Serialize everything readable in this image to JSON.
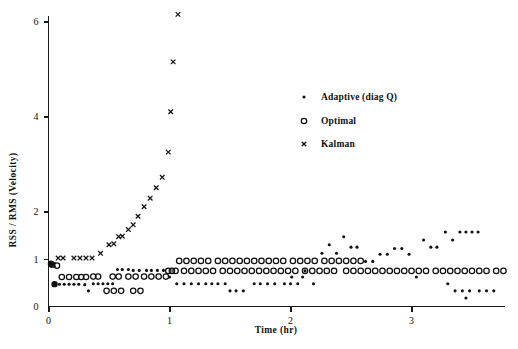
{
  "chart_data": {
    "type": "scatter",
    "title": "",
    "xlabel": "Time (hr)",
    "ylabel": "RSS / RMS (Velocity)",
    "xlim": [
      0,
      3.87
    ],
    "ylim": [
      0,
      6.45
    ],
    "xticks": [
      0,
      1,
      2,
      3
    ],
    "xticklabels": [
      "0",
      "1",
      "2",
      "3"
    ],
    "yticks": [
      0,
      1,
      2,
      4,
      6
    ],
    "yticklabels": [
      "0",
      "1",
      "2",
      "4",
      "6"
    ],
    "grid": false,
    "legend_position": "upper-center-right",
    "series": [
      {
        "name": "Adaptive (diag Q)",
        "marker": "dot",
        "points": [
          [
            0.02,
            0.9
          ],
          [
            0.05,
            0.47
          ],
          [
            0.09,
            0.47
          ],
          [
            0.13,
            0.47
          ],
          [
            0.21,
            0.47
          ],
          [
            0.25,
            0.47
          ],
          [
            0.3,
            0.46
          ],
          [
            0.33,
            0.33
          ],
          [
            0.37,
            0.48
          ],
          [
            0.45,
            0.48
          ],
          [
            0.49,
            0.48
          ],
          [
            0.53,
            0.48
          ],
          [
            0.61,
            0.78
          ],
          [
            0.66,
            0.78
          ],
          [
            0.75,
            0.76
          ],
          [
            0.81,
            0.76
          ],
          [
            0.9,
            0.76
          ],
          [
            0.95,
            0.76
          ],
          [
            1.0,
            0.62
          ],
          [
            1.06,
            0.48
          ],
          [
            1.12,
            0.48
          ],
          [
            1.18,
            0.48
          ],
          [
            1.3,
            0.48
          ],
          [
            1.35,
            0.48
          ],
          [
            1.4,
            0.48
          ],
          [
            1.46,
            0.48
          ],
          [
            1.55,
            0.33
          ],
          [
            1.61,
            0.33
          ],
          [
            1.7,
            0.48
          ],
          [
            1.75,
            0.48
          ],
          [
            1.81,
            0.48
          ],
          [
            1.87,
            0.48
          ],
          [
            1.95,
            0.48
          ],
          [
            2.0,
            0.48
          ],
          [
            2.06,
            0.48
          ],
          [
            2.1,
            0.62
          ],
          [
            2.12,
            0.75
          ],
          [
            2.19,
            0.48
          ],
          [
            2.26,
            1.12
          ],
          [
            2.32,
            1.3
          ],
          [
            2.38,
            1.12
          ],
          [
            2.44,
            1.47
          ],
          [
            2.5,
            1.25
          ],
          [
            2.55,
            1.25
          ],
          [
            2.62,
            0.95
          ],
          [
            2.68,
            0.95
          ],
          [
            2.74,
            1.1
          ],
          [
            2.8,
            1.1
          ],
          [
            2.86,
            1.22
          ],
          [
            2.92,
            1.22
          ],
          [
            2.98,
            1.1
          ],
          [
            3.04,
            0.62
          ],
          [
            3.1,
            1.4
          ],
          [
            3.16,
            1.25
          ],
          [
            3.21,
            1.25
          ],
          [
            3.28,
            1.57
          ],
          [
            3.34,
            1.4
          ],
          [
            3.4,
            1.57
          ],
          [
            3.45,
            1.57
          ],
          [
            3.5,
            1.57
          ],
          [
            3.55,
            1.57
          ],
          [
            3.3,
            0.48
          ],
          [
            3.36,
            0.33
          ],
          [
            3.42,
            0.33
          ],
          [
            3.48,
            0.33
          ],
          [
            3.56,
            0.33
          ],
          [
            3.62,
            0.33
          ],
          [
            3.45,
            0.18
          ],
          [
            0.17,
            0.47
          ],
          [
            0.41,
            0.48
          ],
          [
            0.57,
            0.78
          ],
          [
            0.7,
            0.76
          ],
          [
            0.85,
            0.76
          ],
          [
            1.24,
            0.48
          ],
          [
            1.5,
            0.33
          ],
          [
            2.01,
            0.62
          ],
          [
            3.68,
            0.33
          ]
        ]
      },
      {
        "name": "Optimal",
        "marker": "circle",
        "points": [
          [
            0.03,
            0.88
          ],
          [
            0.07,
            0.86
          ],
          [
            0.11,
            0.62
          ],
          [
            0.17,
            0.62
          ],
          [
            0.23,
            0.62
          ],
          [
            0.27,
            0.62
          ],
          [
            0.31,
            0.62
          ],
          [
            0.37,
            0.63
          ],
          [
            0.41,
            0.63
          ],
          [
            0.48,
            0.33
          ],
          [
            0.54,
            0.33
          ],
          [
            0.6,
            0.33
          ],
          [
            0.7,
            0.33
          ],
          [
            0.76,
            0.33
          ],
          [
            0.53,
            0.63
          ],
          [
            0.58,
            0.63
          ],
          [
            0.66,
            0.63
          ],
          [
            0.72,
            0.63
          ],
          [
            0.79,
            0.63
          ],
          [
            0.85,
            0.63
          ],
          [
            0.91,
            0.63
          ],
          [
            0.97,
            0.63
          ],
          [
            1.02,
            0.75
          ],
          [
            1.08,
            0.96
          ],
          [
            1.14,
            0.96
          ],
          [
            1.2,
            0.96
          ],
          [
            1.26,
            0.96
          ],
          [
            1.32,
            0.96
          ],
          [
            1.4,
            0.96
          ],
          [
            1.46,
            0.96
          ],
          [
            1.52,
            0.96
          ],
          [
            1.58,
            0.96
          ],
          [
            1.64,
            0.96
          ],
          [
            1.7,
            0.96
          ],
          [
            1.76,
            0.96
          ],
          [
            1.82,
            0.96
          ],
          [
            1.88,
            0.96
          ],
          [
            1.94,
            0.96
          ],
          [
            2.02,
            0.96
          ],
          [
            2.08,
            0.96
          ],
          [
            2.14,
            0.96
          ],
          [
            2.2,
            0.96
          ],
          [
            2.28,
            0.96
          ],
          [
            2.34,
            0.96
          ],
          [
            2.4,
            0.96
          ],
          [
            2.46,
            0.96
          ],
          [
            2.52,
            0.96
          ],
          [
            2.58,
            0.96
          ],
          [
            2.46,
            0.75
          ],
          [
            2.52,
            0.75
          ],
          [
            2.58,
            0.75
          ],
          [
            2.64,
            0.75
          ],
          [
            2.7,
            0.75
          ],
          [
            2.76,
            0.75
          ],
          [
            2.82,
            0.75
          ],
          [
            2.88,
            0.75
          ],
          [
            2.94,
            0.75
          ],
          [
            3.0,
            0.75
          ],
          [
            3.06,
            0.75
          ],
          [
            3.12,
            0.75
          ],
          [
            3.2,
            0.75
          ],
          [
            3.26,
            0.75
          ],
          [
            3.32,
            0.75
          ],
          [
            3.38,
            0.75
          ],
          [
            3.44,
            0.75
          ],
          [
            3.5,
            0.75
          ],
          [
            3.56,
            0.75
          ],
          [
            3.62,
            0.75
          ],
          [
            3.7,
            0.75
          ],
          [
            3.76,
            0.75
          ],
          [
            2.24,
            0.75
          ],
          [
            2.3,
            0.75
          ],
          [
            2.36,
            0.75
          ],
          [
            2.12,
            0.75
          ],
          [
            2.18,
            0.75
          ],
          [
            1.18,
            0.75
          ],
          [
            1.24,
            0.75
          ],
          [
            1.3,
            0.75
          ],
          [
            1.36,
            0.75
          ],
          [
            1.44,
            0.75
          ],
          [
            1.5,
            0.75
          ],
          [
            1.56,
            0.75
          ],
          [
            1.62,
            0.75
          ],
          [
            1.68,
            0.75
          ],
          [
            1.74,
            0.75
          ],
          [
            1.8,
            0.75
          ],
          [
            1.86,
            0.75
          ],
          [
            1.92,
            0.75
          ],
          [
            1.98,
            0.75
          ],
          [
            2.04,
            0.75
          ],
          [
            1.12,
            0.75
          ],
          [
            0.99,
            0.75
          ],
          [
            1.05,
            0.75
          ]
        ]
      },
      {
        "name": "Kalman",
        "marker": "x",
        "points": [
          [
            0.08,
            1.02
          ],
          [
            0.12,
            1.02
          ],
          [
            0.21,
            1.02
          ],
          [
            0.26,
            1.02
          ],
          [
            0.31,
            1.02
          ],
          [
            0.36,
            1.02
          ],
          [
            0.43,
            1.12
          ],
          [
            0.5,
            1.3
          ],
          [
            0.54,
            1.32
          ],
          [
            0.58,
            1.47
          ],
          [
            0.61,
            1.48
          ],
          [
            0.66,
            1.62
          ],
          [
            0.7,
            1.72
          ],
          [
            0.74,
            1.9
          ],
          [
            0.79,
            2.1
          ],
          [
            0.84,
            2.28
          ],
          [
            0.89,
            2.5
          ],
          [
            0.94,
            2.72
          ],
          [
            0.99,
            3.25
          ],
          [
            1.01,
            4.1
          ],
          [
            1.03,
            5.15
          ],
          [
            1.07,
            6.15
          ],
          [
            0.04,
            0.88
          ]
        ]
      }
    ]
  },
  "axes": {
    "x_title": "Time (hr)",
    "y_title": "RSS / RMS (Velocity)"
  },
  "legend": {
    "items": [
      {
        "label": "Adaptive (diag Q)",
        "marker": "dot-marker"
      },
      {
        "label": "Optimal",
        "marker": "circle-marker"
      },
      {
        "label": "Kalman",
        "marker": "x-marker"
      }
    ]
  },
  "style": {
    "ink": "#111111",
    "background": "#ffffff"
  }
}
